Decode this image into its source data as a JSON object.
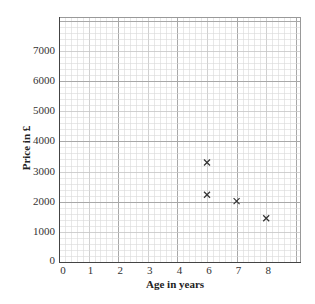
{
  "chart_data": {
    "type": "scatter",
    "title": "",
    "xlabel": "Age in years",
    "ylabel": "Price in £",
    "x_tick_labels": [
      "0",
      "1",
      "2",
      "3",
      "4",
      "6",
      "7",
      "8"
    ],
    "y_tick_labels": [
      "0",
      "1000",
      "2000",
      "3000",
      "4000",
      "5000",
      "6000",
      "7000"
    ],
    "xlim": [
      0,
      8.17
    ],
    "ylim": [
      0,
      8130
    ],
    "grid": true,
    "grid_style": "graph paper: minor lines every 0.2 units, major lines every 2 units",
    "marker": "x",
    "legend": null,
    "points": [
      {
        "x_position": 5,
        "x_label": "6",
        "y": 3300
      },
      {
        "x_position": 5,
        "x_label": "6",
        "y": 2230
      },
      {
        "x_position": 6,
        "x_label": "7",
        "y": 2020
      },
      {
        "x_position": 7,
        "x_label": "8",
        "y": 1450
      }
    ],
    "series": [
      {
        "name": "Price vs age",
        "x": [
          6,
          6,
          7,
          8
        ],
        "y": [
          3300,
          2230,
          2020,
          1450
        ]
      }
    ]
  },
  "axes": {
    "x_title": "Age in years",
    "y_title": "Price in £"
  },
  "colors": {
    "minor_grid": "#d9d9d9",
    "unit_grid": "#c4c4c4",
    "major_grid": "#a8a8a8",
    "axis": "#444444",
    "marker": "#333333"
  }
}
